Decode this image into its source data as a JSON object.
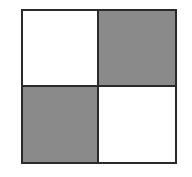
{
  "diagram": {
    "type": "2x2 checkerboard grid",
    "colors": {
      "filled": "#8a8a8a",
      "empty": "#ffffff",
      "border": "#2a2a2a"
    },
    "cells": [
      {
        "row": 0,
        "col": 0,
        "fill": "#ffffff",
        "label": "white"
      },
      {
        "row": 0,
        "col": 1,
        "fill": "#8a8a8a",
        "label": "gray"
      },
      {
        "row": 1,
        "col": 0,
        "fill": "#8a8a8a",
        "label": "gray"
      },
      {
        "row": 1,
        "col": 1,
        "fill": "#ffffff",
        "label": "white"
      }
    ]
  }
}
